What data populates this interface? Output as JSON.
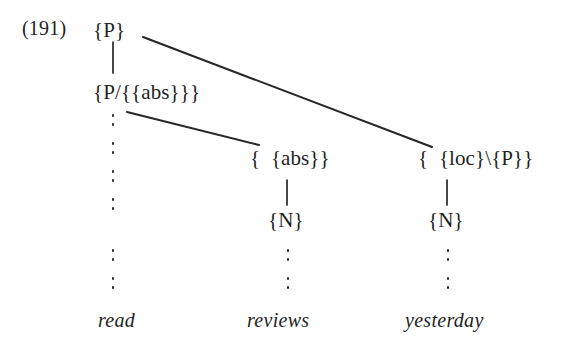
{
  "figure": {
    "example_number": "(191)",
    "kind": "categorial-grammar derivation tree",
    "background_color": "#ffffff",
    "ink_color": "#1f1f1f"
  },
  "nodes": {
    "root": "{P}",
    "root_child": "{P/{{abs}}}",
    "middle_category": "{  {abs}}",
    "right_category": "{  {loc}\\{P}}",
    "middle_noun": "{N}",
    "right_noun": "{N}"
  },
  "terminals": [
    {
      "word": "read"
    },
    {
      "word": "reviews"
    },
    {
      "word": "yesterday"
    }
  ],
  "ellipses": {
    "left_label": "vertical-ellipsis",
    "middle_label": "vertical-ellipsis",
    "right_label": "vertical-ellipsis"
  }
}
